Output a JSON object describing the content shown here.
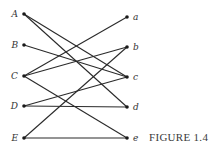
{
  "figure": {
    "caption": "FIGURE 1.4",
    "type": "bipartite-graph",
    "left_nodes": [
      "A",
      "B",
      "C",
      "D",
      "E"
    ],
    "right_nodes": [
      "a",
      "b",
      "c",
      "d",
      "e"
    ],
    "edges": [
      [
        "A",
        "c"
      ],
      [
        "A",
        "d"
      ],
      [
        "B",
        "c"
      ],
      [
        "C",
        "a"
      ],
      [
        "C",
        "b"
      ],
      [
        "C",
        "e"
      ],
      [
        "D",
        "c"
      ],
      [
        "D",
        "d"
      ],
      [
        "E",
        "b"
      ],
      [
        "E",
        "e"
      ]
    ],
    "colors": {
      "edge": "#2a2a2a",
      "node": "#1a1a1a",
      "text": "#333333"
    }
  }
}
